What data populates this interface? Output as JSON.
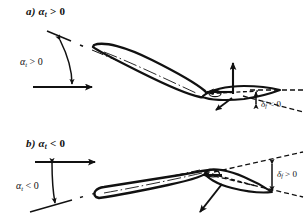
{
  "figure": {
    "background_color": "#ffffff",
    "line_color": "#111111"
  },
  "panels": [
    {
      "id": "a",
      "label": "a) α",
      "label_sub": "t",
      "label_rel": " > 0",
      "angle_label": "α",
      "angle_sub": "t",
      "angle_rel": " > 0",
      "flap_label": "δ",
      "flap_sub": "f",
      "flap_rel": " < 0",
      "airfoil_incidence_deg": -24,
      "flap_deflection_deg": 14,
      "freestream_direction": "rightward-horizontal"
    },
    {
      "id": "b",
      "label": "b) α",
      "label_sub": "t",
      "label_rel": " < 0",
      "angle_label": "α",
      "angle_sub": "t",
      "angle_rel": " < 0",
      "flap_label": "δ",
      "flap_sub": "f",
      "flap_rel": " > 0",
      "airfoil_incidence_deg": -13,
      "flap_deflection_deg": 22,
      "freestream_direction": "rightward-horizontal"
    }
  ],
  "symbols": {
    "alpha": "α",
    "delta": "δ",
    "greater_than": ">",
    "less_than": "<",
    "zero": "0",
    "subscript_t": "t",
    "subscript_f": "f"
  }
}
